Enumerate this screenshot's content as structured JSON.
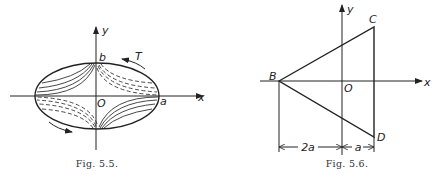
{
  "figures": [
    {
      "id": "fig-5-5",
      "caption": "Fig. 5.5.",
      "description": "Ellipse with semi-axes a and b centered at origin O; solid stress-function contour arcs in 2nd and 4th quadrants, dashed arcs in 1st and 3rd quadrants; torque arrows T on boundary",
      "labels": {
        "y_axis": "y",
        "x_axis": "x",
        "origin": "O",
        "semi_minor": "b",
        "semi_major": "a",
        "torque": "T"
      }
    },
    {
      "id": "fig-5-6",
      "caption": "Fig. 5.6.",
      "description": "Triangle BCD with vertex B on negative x-axis and vertical side CD to the right of the y-axis",
      "labels": {
        "y_axis": "y",
        "x_axis": "x",
        "origin": "O",
        "vertex_b": "B",
        "vertex_c": "C",
        "vertex_d": "D",
        "dim_left": "2a",
        "dim_right": "a"
      }
    }
  ]
}
